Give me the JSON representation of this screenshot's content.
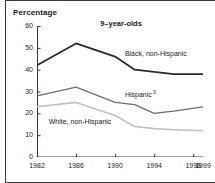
{
  "figure": {
    "axis_title": "Percentage",
    "title": "9–year-olds"
  },
  "chart_data": {
    "type": "line",
    "title": "9–year-olds",
    "xlabel": "",
    "ylabel": "Percentage",
    "ylim": [
      0,
      60
    ],
    "yticks": [
      0,
      10,
      20,
      30,
      40,
      50,
      60
    ],
    "x": [
      1982,
      1986,
      1990,
      1992,
      1994,
      1996,
      1999
    ],
    "xticks": [
      1982,
      1986,
      1990,
      1994,
      1998,
      1999
    ],
    "xtick_labels": [
      "1982",
      "1986",
      "1990",
      "1994",
      "1998",
      "1999"
    ],
    "grid": false,
    "legend": "inline-annotations",
    "series": [
      {
        "name": "Black, non-Hispanic",
        "label": "Black, non-Hispanic",
        "color": "#2b2b2b",
        "width": 1.8,
        "values": [
          42,
          52,
          46,
          40,
          39,
          38,
          38
        ]
      },
      {
        "name": "Hispanic",
        "label": "Hispanic",
        "footnote_marker": "3",
        "color": "#6e6e6e",
        "width": 1.2,
        "values": [
          28,
          32,
          25,
          24,
          20,
          21,
          23
        ]
      },
      {
        "name": "White, non-Hispanic",
        "label": "White, non-Hispanic",
        "color": "#c2c2c2",
        "width": 1.6,
        "values": [
          23,
          25,
          19,
          14,
          13,
          12.5,
          12
        ]
      }
    ],
    "annotations": [
      {
        "text": "Black, non-Hispanic",
        "x": 1991.0,
        "y": 46.5
      },
      {
        "text": "Hispanic",
        "x": 1991.0,
        "y": 29.0
      },
      {
        "text": "White, non-Hispanic",
        "x": 1983.2,
        "y": 15.5
      }
    ]
  }
}
